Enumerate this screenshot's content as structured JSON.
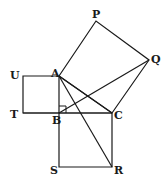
{
  "diagram": {
    "stroke_color": "#1a1a1a",
    "background": "#ffffff",
    "points": {
      "A": {
        "x": 59,
        "y": 76
      },
      "B": {
        "x": 59,
        "y": 113
      },
      "C": {
        "x": 112,
        "y": 113
      },
      "P": {
        "x": 96,
        "y": 21
      },
      "Q": {
        "x": 149,
        "y": 60
      },
      "R": {
        "x": 112,
        "y": 167
      },
      "S": {
        "x": 59,
        "y": 167
      },
      "T": {
        "x": 23,
        "y": 113
      },
      "U": {
        "x": 23,
        "y": 76
      }
    },
    "labels": {
      "A": "A",
      "B": "B",
      "C": "C",
      "P": "P",
      "Q": "Q",
      "R": "R",
      "S": "S",
      "T": "T",
      "U": "U"
    },
    "squares": [
      {
        "name": "square-ABTU",
        "vertices": [
          "A",
          "B",
          "T",
          "U"
        ]
      },
      {
        "name": "square-BCRS",
        "vertices": [
          "B",
          "C",
          "R",
          "S"
        ]
      },
      {
        "name": "square-ACQP",
        "vertices": [
          "A",
          "C",
          "Q",
          "P"
        ]
      }
    ],
    "extra_segments": [
      [
        "A",
        "R"
      ],
      [
        "B",
        "Q"
      ],
      [
        "A",
        "C"
      ]
    ],
    "right_angle_marker": {
      "at": "B",
      "size": 7
    }
  }
}
